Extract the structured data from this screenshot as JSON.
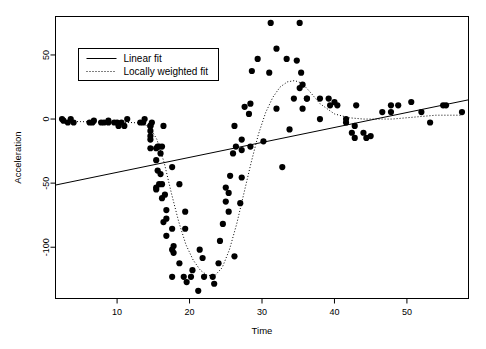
{
  "chart_data": {
    "type": "scatter",
    "title": "",
    "xlabel": "Time",
    "ylabel": "Acceleration",
    "xlim": [
      1.5,
      58.5
    ],
    "ylim": [
      -140,
      80
    ],
    "xticks": [
      10,
      20,
      30,
      40,
      50
    ],
    "yticks": [
      50,
      0,
      -50,
      -100
    ],
    "xtick_labels": [
      "10",
      "20",
      "30",
      "40",
      "50"
    ],
    "ytick_labels": [
      "50",
      "0",
      "-50",
      "-100"
    ],
    "grid": false,
    "legend_position": "top-left",
    "point_color": "#000000",
    "point_size": 3.1,
    "line_color": "#000000",
    "series": [
      {
        "name": "points",
        "kind": "scatter",
        "x": [
          2.4,
          2.6,
          3.2,
          3.6,
          4.0,
          6.2,
          6.6,
          6.8,
          7.8,
          8.2,
          8.8,
          8.8,
          9.6,
          10.0,
          10.2,
          10.6,
          11.0,
          11.4,
          13.2,
          13.6,
          13.8,
          14.6,
          14.6,
          14.6,
          14.6,
          14.6,
          14.6,
          14.8,
          15.4,
          15.4,
          15.4,
          15.4,
          15.6,
          15.6,
          15.8,
          15.8,
          16.0,
          16.0,
          16.2,
          16.2,
          16.2,
          16.4,
          16.4,
          16.6,
          16.8,
          16.8,
          16.8,
          17.6,
          17.6,
          17.6,
          17.6,
          17.8,
          17.8,
          18.6,
          18.6,
          19.2,
          19.4,
          19.4,
          19.6,
          20.2,
          20.4,
          21.2,
          21.4,
          21.8,
          22.0,
          23.2,
          23.4,
          24.0,
          24.2,
          24.6,
          25.0,
          25.0,
          25.4,
          25.4,
          25.6,
          26.0,
          26.2,
          26.2,
          26.4,
          27.0,
          27.2,
          27.2,
          27.2,
          27.6,
          28.2,
          28.4,
          28.4,
          28.6,
          29.4,
          30.2,
          31.0,
          31.2,
          32.0,
          32.0,
          32.8,
          33.4,
          33.8,
          34.4,
          34.8,
          35.2,
          35.2,
          35.4,
          35.6,
          35.6,
          36.2,
          36.2,
          38.0,
          38.0,
          39.2,
          39.4,
          40.0,
          40.4,
          41.6,
          41.6,
          42.4,
          42.8,
          42.8,
          43.0,
          44.0,
          44.4,
          45.0,
          46.6,
          47.8,
          47.8,
          48.8,
          50.6,
          52.0,
          53.2,
          55.0,
          55.4,
          57.6
        ],
        "y": [
          0.0,
          -1.3,
          -2.7,
          0.0,
          -2.7,
          -2.7,
          -2.7,
          -1.3,
          -2.7,
          -2.7,
          -1.3,
          -2.7,
          -2.7,
          -2.7,
          -5.4,
          -2.7,
          -5.4,
          0.0,
          -2.7,
          -2.7,
          0.0,
          -13.3,
          -5.4,
          -5.4,
          -9.3,
          -16.0,
          -22.8,
          -2.7,
          -22.8,
          -32.1,
          -53.5,
          -54.9,
          -40.2,
          -21.5,
          -21.5,
          -50.8,
          -42.9,
          -26.8,
          -21.5,
          -50.8,
          -61.7,
          -5.4,
          -80.4,
          -59.0,
          -71.0,
          -91.1,
          -77.7,
          -37.5,
          -85.6,
          -123.1,
          -101.9,
          -99.1,
          -104.4,
          -112.5,
          -50.8,
          -123.1,
          -85.6,
          -72.3,
          -127.2,
          -123.1,
          -117.9,
          -134.0,
          -101.9,
          -108.4,
          -123.1,
          -123.1,
          -128.5,
          -112.5,
          -95.1,
          -81.8,
          -53.5,
          -64.4,
          -57.6,
          -72.3,
          -44.3,
          -26.8,
          -5.4,
          -107.1,
          -21.5,
          -65.6,
          -16.0,
          -45.6,
          -24.2,
          9.5,
          4.0,
          12.0,
          -21.5,
          37.5,
          46.9,
          -17.4,
          36.2,
          75.0,
          8.1,
          54.9,
          -37.5,
          46.9,
          -8.1,
          16.0,
          45.6,
          24.2,
          75.0,
          36.2,
          26.8,
          8.1,
          16.0,
          16.0,
          16.0,
          0.0,
          16.0,
          10.7,
          13.3,
          10.7,
          0.0,
          -2.7,
          -10.7,
          -14.7,
          -5.4,
          10.7,
          -10.7,
          -14.7,
          -13.3,
          5.4,
          10.7,
          5.4,
          10.7,
          13.3,
          5.4,
          -2.7,
          10.7,
          10.7,
          5.4
        ],
        "count": 130
      },
      {
        "name": "Linear fit",
        "kind": "line",
        "style": "solid",
        "x": [
          1.5,
          58.5
        ],
        "y": [
          -51.5,
          15.0
        ]
      },
      {
        "name": "Locally weighted fit",
        "kind": "line",
        "style": "dotted",
        "x": [
          2.4,
          5.0,
          8.0,
          11.0,
          13.0,
          14.5,
          15.5,
          16.5,
          17.5,
          18.5,
          19.5,
          20.5,
          21.5,
          22.5,
          23.5,
          24.5,
          25.5,
          26.5,
          27.5,
          28.5,
          29.5,
          30.5,
          31.5,
          32.5,
          33.5,
          34.5,
          35.5,
          36.5,
          38.0,
          40.0,
          42.0,
          44.0,
          46.0,
          48.0,
          50.0,
          52.0,
          54.0,
          56.0,
          57.6
        ],
        "y": [
          -2.0,
          -2.0,
          -2.5,
          -2.5,
          -3.0,
          -6.0,
          -16.0,
          -34.0,
          -58.0,
          -80.0,
          -98.0,
          -110.0,
          -118.0,
          -122.0,
          -122.0,
          -116.0,
          -102.0,
          -82.0,
          -58.0,
          -34.0,
          -12.0,
          5.0,
          17.0,
          25.0,
          29.0,
          30.0,
          28.0,
          22.0,
          12.0,
          4.0,
          1.0,
          0.0,
          0.0,
          0.0,
          1.0,
          2.0,
          3.0,
          3.0,
          3.0
        ]
      }
    ],
    "legend": [
      {
        "label": "Linear fit",
        "style": "solid"
      },
      {
        "label": "Locally weighted fit",
        "style": "dotted"
      }
    ]
  }
}
